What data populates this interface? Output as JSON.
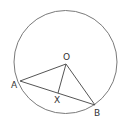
{
  "diagram": {
    "type": "circle-geometry",
    "colors": {
      "background": "#ffffff",
      "circle": "#7a7a7a",
      "lines": "#555555",
      "labels": "#333333"
    },
    "circle": {
      "cx": 65.5,
      "cy": 62,
      "r": 51.5
    },
    "points": {
      "O": {
        "label": "O",
        "x": 66,
        "y": 64,
        "label_x": 63,
        "label_y": 60
      },
      "A": {
        "label": "A",
        "x": 20,
        "y": 81,
        "label_x": 11,
        "label_y": 88
      },
      "B": {
        "label": "B",
        "x": 95,
        "y": 105,
        "label_x": 94,
        "label_y": 116
      },
      "X": {
        "label": "X",
        "x": 58,
        "y": 93,
        "label_x": 54,
        "label_y": 103
      }
    },
    "segments": [
      {
        "name": "OA",
        "from": "O",
        "to": "A"
      },
      {
        "name": "OB",
        "from": "O",
        "to": "B"
      },
      {
        "name": "AB",
        "from": "A",
        "to": "B"
      },
      {
        "name": "OX",
        "from": "O",
        "to": "X"
      }
    ]
  }
}
